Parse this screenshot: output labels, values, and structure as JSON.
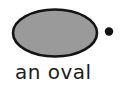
{
  "figure": {
    "label": "an oval",
    "shape": "oval",
    "fill_color": "#9a9a9a",
    "outline_color": "#141414",
    "bullet_color": "#111111",
    "background_color": "#ffffff",
    "label_color": "#1c1c1c"
  }
}
